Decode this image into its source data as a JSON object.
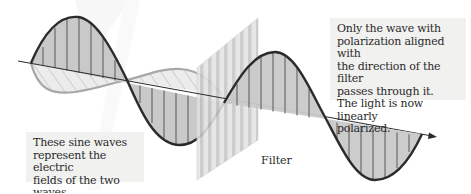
{
  "diagram": {
    "colors": {
      "dark_wave_stroke": "#2b2b2b",
      "dark_wave_fill": "#c8c8c8",
      "light_wave_stroke": "#a6a6a6",
      "light_wave_fill": "#e6e6e6",
      "filter_stripe_light": "#e3e3e3",
      "filter_stripe_dark": "#c2c2c2",
      "callout_bg": "#f1f1f0",
      "watermark": "#f2f2f2"
    },
    "labels": {
      "left_callout": [
        "These sine waves",
        "represent the electric",
        "fields of the two waves."
      ],
      "right_callout": [
        "Only the wave with",
        "polarization aligned with",
        "the direction of the filter",
        "passes through it.",
        "The light is now linearly",
        "polarized."
      ],
      "filter": "Filter"
    },
    "icons": {
      "propagation_arrow": "arrow-right-icon"
    }
  }
}
